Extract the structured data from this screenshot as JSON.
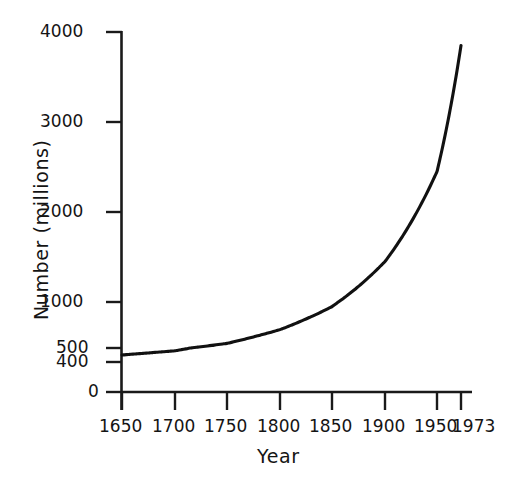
{
  "chart_data": {
    "type": "line",
    "title": "",
    "xlabel": "Year",
    "ylabel": "Number (millions)",
    "x": [
      1650,
      1700,
      1750,
      1800,
      1850,
      1900,
      1950,
      1973
    ],
    "values": [
      450,
      480,
      550,
      700,
      950,
      1450,
      2450,
      3850
    ],
    "series": [
      {
        "name": "World population",
        "values": [
          450,
          480,
          550,
          700,
          950,
          1450,
          2450,
          3850
        ]
      }
    ],
    "xticks": [
      "1650",
      "1700",
      "1750",
      "1800",
      "1850",
      "1900",
      "1950",
      "1973"
    ],
    "xtick_values": [
      1650,
      1700,
      1750,
      1800,
      1850,
      1900,
      1950,
      1973
    ],
    "yticks": [
      "0",
      "400",
      "500",
      "1000",
      "2000",
      "3000",
      "4000"
    ],
    "ytick_values": [
      0,
      400,
      500,
      1000,
      2000,
      3000,
      4000
    ],
    "xlim": [
      1650,
      1973
    ],
    "ylim": [
      0,
      4000
    ],
    "grid": false,
    "legend": false,
    "legend_position": "none",
    "line_color": "#111111",
    "background_color": "#ffffff",
    "axis_color": "#1a1a1a",
    "y_axis_note": "non-linear spacing: 400 and 500 ticks compressed near the origin"
  },
  "axis": {
    "y_title": "Number (millions)",
    "x_title": "Year",
    "y_ticks": [
      {
        "label": "4000",
        "value": 4000
      },
      {
        "label": "3000",
        "value": 3000
      },
      {
        "label": "2000",
        "value": 2000
      },
      {
        "label": "1000",
        "value": 1000
      },
      {
        "label": "500",
        "value": 500
      },
      {
        "label": "400",
        "value": 400
      },
      {
        "label": "0",
        "value": 0
      }
    ],
    "x_ticks": [
      {
        "label": "1650",
        "value": 1650
      },
      {
        "label": "1700",
        "value": 1700
      },
      {
        "label": "1750",
        "value": 1750
      },
      {
        "label": "1800",
        "value": 1800
      },
      {
        "label": "1850",
        "value": 1850
      },
      {
        "label": "1900",
        "value": 1900
      },
      {
        "label": "1950",
        "value": 1950
      },
      {
        "label": "1973",
        "value": 1973
      }
    ]
  }
}
